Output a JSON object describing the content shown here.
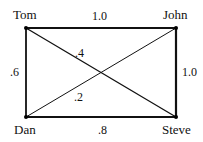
{
  "diagram": {
    "type": "weighted-graph",
    "colors": {
      "line": "#111111",
      "background": "#ffffff"
    },
    "nodes": [
      {
        "id": "tom",
        "label": "Tom",
        "x": 26,
        "y": 28
      },
      {
        "id": "john",
        "label": "John",
        "x": 176,
        "y": 28
      },
      {
        "id": "dan",
        "label": "Dan",
        "x": 26,
        "y": 117
      },
      {
        "id": "steve",
        "label": "Steve",
        "x": 176,
        "y": 117
      }
    ],
    "edges": [
      {
        "from": "tom",
        "to": "john",
        "weight": "1.0"
      },
      {
        "from": "john",
        "to": "steve",
        "weight": "1.0"
      },
      {
        "from": "tom",
        "to": "dan",
        "weight": ".6"
      },
      {
        "from": "dan",
        "to": "steve",
        "weight": ".8"
      },
      {
        "from": "tom",
        "to": "steve",
        "weight": ".4"
      },
      {
        "from": "dan",
        "to": "john",
        "weight": ".2"
      }
    ]
  }
}
